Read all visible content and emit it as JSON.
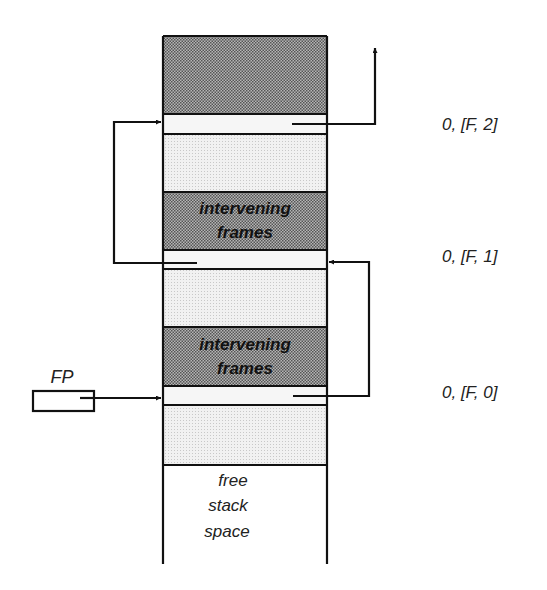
{
  "diagram": {
    "type": "stack-frame-chain",
    "stack": {
      "regions": [
        {
          "kind": "frame-body",
          "shade": "dark"
        },
        {
          "kind": "link-slot",
          "label_id": "F2"
        },
        {
          "kind": "frame-body",
          "shade": "light"
        },
        {
          "kind": "intervening",
          "shade": "dark",
          "text_line1": "intervening",
          "text_line2": "frames"
        },
        {
          "kind": "link-slot",
          "label_id": "F1"
        },
        {
          "kind": "frame-body",
          "shade": "light"
        },
        {
          "kind": "intervening",
          "shade": "dark",
          "text_line1": "intervening",
          "text_line2": "frames"
        },
        {
          "kind": "link-slot",
          "label_id": "F0"
        },
        {
          "kind": "frame-body",
          "shade": "light"
        },
        {
          "kind": "free-space",
          "text_line1": "free",
          "text_line2": "stack",
          "text_line3": "space"
        }
      ]
    },
    "slot_labels": {
      "F2": "0, [F, 2]",
      "F1": "0, [F, 1]",
      "F0": "0, [F, 0]"
    },
    "frame_pointer": {
      "label": "FP"
    },
    "colors": {
      "line": "#111111",
      "dark_shade": "#9a9a9a",
      "light_shade": "#e6e6e6",
      "background": "#ffffff"
    }
  }
}
